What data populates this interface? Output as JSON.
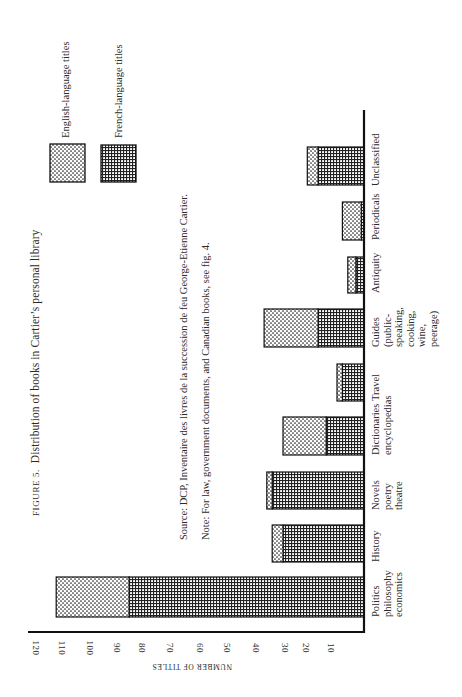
{
  "figure": {
    "label": "FIGURE 5.",
    "title": "Distribution of books in Cartier’s personal library",
    "source": "Source: DCP, Inventaire des livres de la succession de feu George-Etienne Cartier.",
    "note": "Note: For law, government documents, and Canadian books, see fig. 4."
  },
  "legend": {
    "english": "English-language titles",
    "french": "French-language titles"
  },
  "axis": {
    "ylabel": "NUMBER OF TITLES",
    "ticks": [
      "120",
      "110",
      "100",
      "90",
      "80",
      "70",
      "60",
      "50",
      "40",
      "30",
      "20",
      "10"
    ]
  },
  "categories_display": [
    "Politics\nphilosophy\neconomics",
    "History",
    "Novels\npoetry\ntheatre",
    "Dictionaries\nencyclopedias",
    "Travel",
    "Guides\n(public-\nspeaking,\ncooking,\nwine,\npeerage)",
    "Antiquity",
    "Periodicals",
    "Unclassified"
  ],
  "colors": {
    "ink": "#1a1a1a",
    "paper": "#ffffff"
  },
  "chart_data": {
    "type": "bar",
    "stacked": true,
    "orientation": "vertical (page printed rotated 90°)",
    "xlabel": "",
    "ylabel": "NUMBER OF TITLES",
    "ylim": [
      0,
      120
    ],
    "yticks": [
      10,
      20,
      30,
      40,
      50,
      60,
      70,
      80,
      90,
      100,
      110,
      120
    ],
    "grid": false,
    "legend_position": "top-right (rotated)",
    "categories": [
      "Politics philosophy economics",
      "History",
      "Novels poetry theatre",
      "Dictionaries encyclopedias",
      "Travel",
      "Guides (public-speaking, cooking, wine, peerage)",
      "Antiquity",
      "Periodicals",
      "Unclassified"
    ],
    "series": [
      {
        "name": "French-language titles",
        "pattern": "cross-hatch",
        "values": [
          87,
          30,
          34,
          14,
          8,
          17,
          3,
          1,
          17
        ]
      },
      {
        "name": "English-language titles",
        "pattern": "dotted",
        "values": [
          27,
          4,
          2,
          16,
          2,
          20,
          3,
          7,
          4
        ]
      }
    ],
    "totals": [
      114,
      34,
      36,
      30,
      10,
      37,
      6,
      8,
      21
    ],
    "annotations": [
      "Source: DCP, Inventaire des livres de la succession de feu George-Etienne Cartier.",
      "Note: For law, government documents, and Canadian books, see fig. 4."
    ]
  }
}
